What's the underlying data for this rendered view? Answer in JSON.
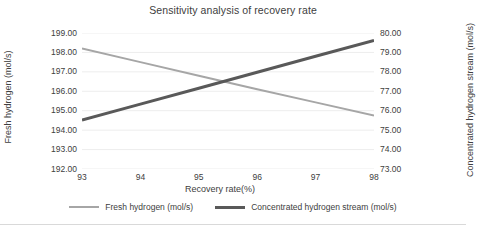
{
  "chart_data": {
    "type": "line",
    "title": "Sensitivity analysis of recovery rate",
    "xlabel": "Recovery rate(%)",
    "ylabel": "Fresh hydrogen (mol/s)",
    "y2label": "Concentrated hydrogen stream (mol/s)",
    "x": [
      93,
      94,
      95,
      96,
      97,
      98
    ],
    "xlim": [
      93,
      98
    ],
    "xticks": [
      "93",
      "94",
      "95",
      "96",
      "97",
      "98"
    ],
    "ylim": [
      192.0,
      199.0
    ],
    "yticks": [
      "192.00",
      "193.00",
      "194.00",
      "195.00",
      "196.00",
      "197.00",
      "198.00",
      "199.00"
    ],
    "y2lim": [
      73.0,
      80.0
    ],
    "y2ticks": [
      "73.00",
      "74.00",
      "75.00",
      "76.00",
      "77.00",
      "78.00",
      "79.00",
      "80.00"
    ],
    "grid": true,
    "legend_position": "bottom",
    "series": [
      {
        "name": "Fresh hydrogen (mol/s)",
        "axis": "left",
        "color": "#a6a6a6",
        "width": 2,
        "values": [
          198.2,
          197.5,
          196.8,
          196.1,
          195.43,
          194.75
        ]
      },
      {
        "name": "Concentrated hydrogen stream (mol/s)",
        "axis": "right",
        "color": "#595959",
        "width": 3,
        "values": [
          75.52,
          76.34,
          77.16,
          77.98,
          78.8,
          79.62
        ]
      }
    ]
  },
  "style": {
    "grid_color": "#ededed",
    "text_color": "#404040",
    "frame_color": "#d9d9d9",
    "background": "#ffffff"
  }
}
